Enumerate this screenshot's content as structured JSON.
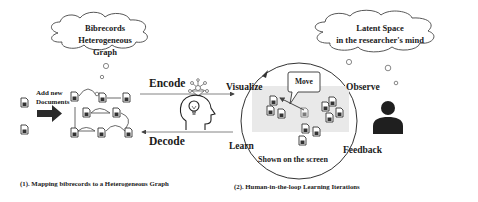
{
  "left_cloud": {
    "line1": "Bibrecords",
    "line2": "Heterogeneous Graph"
  },
  "right_cloud": {
    "line1": "Latent Space",
    "line2": "in the researcher's mind"
  },
  "add_documents": {
    "line1": "Add new",
    "line2": "Documents"
  },
  "arrows": {
    "encode": "Encode",
    "decode": "Decode"
  },
  "loop": {
    "visualize": "Visualize",
    "observe": "Observe",
    "feedback": "Feedback",
    "learn": "Learn",
    "move_callout": "Move",
    "screen_label": "Shown on the screen"
  },
  "captions": {
    "left": "(1). Mapping bibrecords to a  Heterogeneous Graph",
    "right": "(2). Human-in-the-loop Learning Iterations"
  },
  "icons": {
    "document": "document-icon",
    "head": "head-with-lightbulb-icon",
    "network": "network-icon",
    "person": "person-icon",
    "big_arrow": "right-arrow-icon"
  },
  "colors": {
    "stroke": "#333333",
    "screen_bg": "#e9e9e9",
    "arrow_fill": "#2b2b2b",
    "person": "#1f1f1f"
  }
}
